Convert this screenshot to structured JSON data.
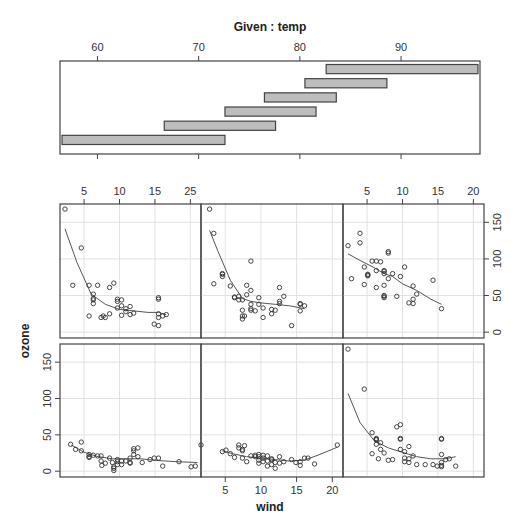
{
  "chart_data": {
    "type": "coplot",
    "title": "Given : temp",
    "xlabel": "wind",
    "ylabel": "ozone",
    "given": {
      "variable": "temp",
      "axis_ticks": [
        60,
        70,
        80,
        90
      ],
      "xlim": [
        56.3,
        97.8
      ],
      "intervals": [
        [
          56.5,
          72.6
        ],
        [
          66.6,
          77.6
        ],
        [
          72.6,
          81.6
        ],
        [
          76.5,
          83.6
        ],
        [
          80.5,
          88.6
        ],
        [
          82.6,
          97.6
        ]
      ]
    },
    "panel_axes": {
      "xlim": [
        1.6,
        21.5
      ],
      "ylim": [
        -8,
        175
      ],
      "x_ticks": [
        5,
        10,
        15,
        20
      ],
      "x_tick_labels_top_left": [
        "5",
        "10",
        "15",
        "25"
      ],
      "x_tick_labels_top_right": [
        "5",
        "10",
        "15",
        "20"
      ],
      "x_tick_labels_bottom_middle": [
        "5",
        "10",
        "15",
        "20"
      ],
      "y_ticks": [
        0,
        50,
        100,
        150
      ],
      "y_tick_labels": [
        "0",
        "50",
        "100",
        "150"
      ],
      "grid": true
    },
    "panels": [
      {
        "name": "temp 56.5-72.6",
        "row": 1,
        "col": 0,
        "points": [
          [
            3.1,
            37
          ],
          [
            3.8,
            30
          ],
          [
            4.6,
            28
          ],
          [
            4.6,
            40
          ],
          [
            5.7,
            19
          ],
          [
            5.7,
            20
          ],
          [
            5.7,
            23
          ],
          [
            6.3,
            22
          ],
          [
            6.9,
            21
          ],
          [
            7.4,
            21
          ],
          [
            7.4,
            14
          ],
          [
            7.5,
            8
          ],
          [
            8.0,
            11
          ],
          [
            8.6,
            18
          ],
          [
            9.0,
            12
          ],
          [
            9.2,
            1
          ],
          [
            9.2,
            4
          ],
          [
            9.2,
            6
          ],
          [
            9.7,
            9
          ],
          [
            9.7,
            13
          ],
          [
            9.7,
            16
          ],
          [
            10.3,
            9
          ],
          [
            10.3,
            14
          ],
          [
            10.9,
            14
          ],
          [
            11.5,
            11
          ],
          [
            11.5,
            18
          ],
          [
            11.5,
            12
          ],
          [
            12.0,
            31
          ],
          [
            12.0,
            28
          ],
          [
            12.0,
            23
          ],
          [
            12.6,
            32
          ],
          [
            12.6,
            20
          ],
          [
            13.2,
            12
          ],
          [
            14.3,
            16
          ],
          [
            14.9,
            18
          ],
          [
            15.5,
            18
          ],
          [
            16.1,
            7
          ],
          [
            18.4,
            13
          ],
          [
            20.1,
            6
          ],
          [
            20.7,
            7
          ],
          [
            21.5,
            36
          ]
        ],
        "smooth": [
          [
            3.2,
            36
          ],
          [
            5,
            26
          ],
          [
            7,
            20
          ],
          [
            9,
            17
          ],
          [
            11,
            17
          ],
          [
            13,
            17
          ],
          [
            15,
            15
          ],
          [
            18,
            13
          ],
          [
            21,
            12
          ]
        ]
      },
      {
        "name": "temp 66.6-77.6",
        "row": 1,
        "col": 1,
        "points": [
          [
            4.6,
            27
          ],
          [
            5.1,
            29
          ],
          [
            5.7,
            24
          ],
          [
            6.3,
            19
          ],
          [
            6.9,
            36
          ],
          [
            6.9,
            32
          ],
          [
            7.4,
            28
          ],
          [
            7.4,
            30
          ],
          [
            7.4,
            18
          ],
          [
            7.7,
            35
          ],
          [
            8.0,
            13
          ],
          [
            8.6,
            21
          ],
          [
            9.2,
            20
          ],
          [
            9.2,
            22
          ],
          [
            9.7,
            20
          ],
          [
            9.7,
            15
          ],
          [
            9.7,
            11
          ],
          [
            9.7,
            23
          ],
          [
            10.3,
            13
          ],
          [
            10.3,
            18
          ],
          [
            10.3,
            22
          ],
          [
            10.9,
            7
          ],
          [
            10.9,
            21
          ],
          [
            10.9,
            14
          ],
          [
            11.5,
            9
          ],
          [
            11.5,
            16
          ],
          [
            11.5,
            17
          ],
          [
            12.0,
            12
          ],
          [
            12.0,
            4
          ],
          [
            12.6,
            20
          ],
          [
            12.6,
            11
          ],
          [
            13.2,
            13
          ],
          [
            14.3,
            16
          ],
          [
            14.9,
            12
          ],
          [
            15.5,
            8
          ],
          [
            15.5,
            13
          ],
          [
            16.1,
            18
          ],
          [
            16.6,
            18
          ],
          [
            17.5,
            10
          ],
          [
            20.7,
            36
          ]
        ],
        "smooth": [
          [
            4.6,
            28
          ],
          [
            6,
            24
          ],
          [
            8,
            20
          ],
          [
            10,
            18
          ],
          [
            12,
            16
          ],
          [
            14,
            14
          ],
          [
            16,
            15
          ],
          [
            18,
            22
          ],
          [
            20.7,
            33
          ]
        ]
      },
      {
        "name": "temp 72.6-81.6",
        "row": 1,
        "col": 2,
        "points": [
          [
            2.3,
            168
          ],
          [
            4.6,
            113
          ],
          [
            5.7,
            53
          ],
          [
            6.3,
            45
          ],
          [
            6.3,
            44
          ],
          [
            6.3,
            43
          ],
          [
            6.3,
            37
          ],
          [
            6.9,
            30
          ],
          [
            6.9,
            39
          ],
          [
            5.7,
            24
          ],
          [
            6.6,
            17
          ],
          [
            7.4,
            25
          ],
          [
            8.0,
            15
          ],
          [
            8.6,
            16
          ],
          [
            9.2,
            61
          ],
          [
            9.7,
            64
          ],
          [
            9.7,
            44
          ],
          [
            9.7,
            45
          ],
          [
            9.7,
            30
          ],
          [
            10.3,
            27
          ],
          [
            10.3,
            18
          ],
          [
            10.3,
            13
          ],
          [
            10.9,
            34
          ],
          [
            10.9,
            17
          ],
          [
            10.9,
            12
          ],
          [
            11.5,
            21
          ],
          [
            12.0,
            9
          ],
          [
            13.2,
            9
          ],
          [
            14.3,
            9
          ],
          [
            14.9,
            7
          ],
          [
            15.5,
            8
          ],
          [
            15.5,
            6
          ],
          [
            15.5,
            12
          ],
          [
            15.5,
            23
          ],
          [
            15.5,
            44
          ],
          [
            15.5,
            45
          ],
          [
            16.1,
            16
          ],
          [
            16.6,
            17
          ],
          [
            17.5,
            7
          ]
        ],
        "smooth": [
          [
            2.3,
            107
          ],
          [
            4,
            67
          ],
          [
            6,
            42
          ],
          [
            8,
            32
          ],
          [
            10,
            26
          ],
          [
            12,
            20
          ],
          [
            14,
            17
          ],
          [
            16,
            17
          ],
          [
            17.5,
            20
          ]
        ]
      },
      {
        "name": "temp 76.5-83.6",
        "row": 0,
        "col": 0,
        "points": [
          [
            2.3,
            168
          ],
          [
            4.6,
            115
          ],
          [
            3.4,
            64
          ],
          [
            5.7,
            64
          ],
          [
            6.3,
            52
          ],
          [
            6.3,
            46
          ],
          [
            6.3,
            44
          ],
          [
            6.3,
            39
          ],
          [
            6.9,
            64
          ],
          [
            5.7,
            22
          ],
          [
            7.4,
            20
          ],
          [
            7.7,
            22
          ],
          [
            8.0,
            20
          ],
          [
            8.6,
            25
          ],
          [
            8.6,
            61
          ],
          [
            9.2,
            67
          ],
          [
            9.7,
            45
          ],
          [
            9.7,
            42
          ],
          [
            9.7,
            33
          ],
          [
            10.3,
            44
          ],
          [
            10.3,
            36
          ],
          [
            10.3,
            23
          ],
          [
            10.9,
            32
          ],
          [
            10.9,
            28
          ],
          [
            11.5,
            35
          ],
          [
            11.5,
            24
          ],
          [
            12.0,
            26
          ],
          [
            14.9,
            11
          ],
          [
            15.5,
            9
          ],
          [
            15.5,
            45
          ],
          [
            15.5,
            47
          ],
          [
            15.5,
            25
          ],
          [
            15.5,
            20
          ],
          [
            16.1,
            22
          ],
          [
            16.6,
            24
          ]
        ],
        "smooth": [
          [
            2.3,
            141
          ],
          [
            4,
            95
          ],
          [
            6,
            52
          ],
          [
            8,
            38
          ],
          [
            10,
            31
          ],
          [
            12,
            29
          ],
          [
            14,
            27
          ],
          [
            15.5,
            27
          ],
          [
            16.6,
            24
          ]
        ]
      },
      {
        "name": "temp 80.5-88.6",
        "row": 0,
        "col": 1,
        "points": [
          [
            2.8,
            168
          ],
          [
            3.4,
            135
          ],
          [
            4.6,
            79
          ],
          [
            4.6,
            76
          ],
          [
            4.6,
            80
          ],
          [
            3.4,
            66
          ],
          [
            5.7,
            63
          ],
          [
            6.3,
            48
          ],
          [
            6.3,
            47
          ],
          [
            6.9,
            44
          ],
          [
            6.9,
            49
          ],
          [
            7.4,
            44
          ],
          [
            7.4,
            30
          ],
          [
            7.4,
            22
          ],
          [
            7.4,
            18
          ],
          [
            7.7,
            22
          ],
          [
            8.0,
            51
          ],
          [
            8.6,
            97
          ],
          [
            8.0,
            64
          ],
          [
            8.6,
            57
          ],
          [
            8.6,
            38
          ],
          [
            8.6,
            30
          ],
          [
            8.6,
            32
          ],
          [
            9.2,
            29
          ],
          [
            9.7,
            47
          ],
          [
            9.7,
            38
          ],
          [
            10.3,
            20
          ],
          [
            10.3,
            33
          ],
          [
            11.5,
            25
          ],
          [
            11.5,
            31
          ],
          [
            12.0,
            30
          ],
          [
            12.6,
            61
          ],
          [
            12.6,
            39
          ],
          [
            12.6,
            42
          ],
          [
            13.2,
            49
          ],
          [
            14.3,
            9
          ],
          [
            15.5,
            39
          ],
          [
            15.5,
            38
          ],
          [
            15.5,
            29
          ],
          [
            16.1,
            36
          ]
        ],
        "smooth": [
          [
            2.8,
            139
          ],
          [
            4,
            110
          ],
          [
            5.7,
            71
          ],
          [
            7.4,
            46
          ],
          [
            8.6,
            42
          ],
          [
            10,
            40
          ],
          [
            12,
            38
          ],
          [
            14,
            36
          ],
          [
            16.1,
            32
          ]
        ]
      },
      {
        "name": "temp 82.6-97.6",
        "row": 0,
        "col": 2,
        "points": [
          [
            2.3,
            118
          ],
          [
            4.0,
            135
          ],
          [
            4.0,
            122
          ],
          [
            2.8,
            73
          ],
          [
            4.6,
            89
          ],
          [
            5.1,
            78
          ],
          [
            5.1,
            77
          ],
          [
            5.1,
            79
          ],
          [
            4.6,
            65
          ],
          [
            5.7,
            97
          ],
          [
            6.3,
            97
          ],
          [
            6.9,
            96
          ],
          [
            6.3,
            84
          ],
          [
            7.4,
            84
          ],
          [
            7.4,
            83
          ],
          [
            7.4,
            80
          ],
          [
            7.4,
            64
          ],
          [
            6.3,
            61
          ],
          [
            7.4,
            50
          ],
          [
            7.4,
            47
          ],
          [
            7.4,
            49
          ],
          [
            8.0,
            108
          ],
          [
            8.0,
            110
          ],
          [
            8.0,
            73
          ],
          [
            8.6,
            80
          ],
          [
            9.2,
            49
          ],
          [
            9.7,
            76
          ],
          [
            10.3,
            89
          ],
          [
            10.9,
            40
          ],
          [
            11.5,
            63
          ],
          [
            11.5,
            45
          ],
          [
            11.5,
            39
          ],
          [
            12.0,
            52
          ],
          [
            14.3,
            71
          ],
          [
            15.5,
            32
          ]
        ],
        "smooth": [
          [
            2.3,
            107
          ],
          [
            4,
            98
          ],
          [
            6,
            88
          ],
          [
            7.4,
            80
          ],
          [
            8.6,
            76
          ],
          [
            10,
            66
          ],
          [
            12,
            57
          ],
          [
            14,
            45
          ],
          [
            15.5,
            38
          ]
        ]
      }
    ]
  }
}
